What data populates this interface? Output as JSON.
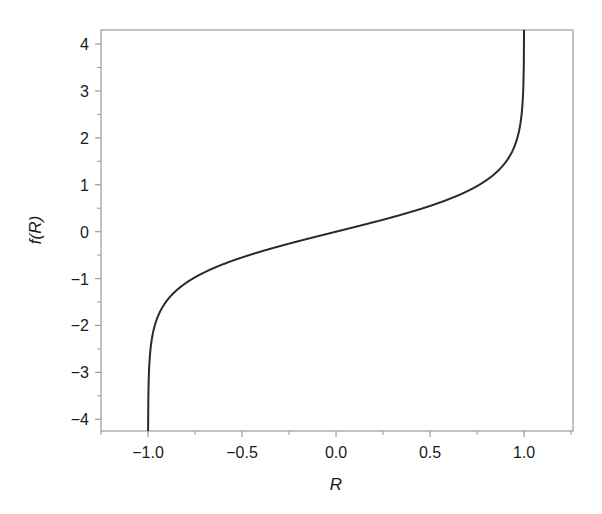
{
  "chart_data": {
    "type": "line",
    "title": "",
    "xlabel": "R",
    "ylabel": "f(R)",
    "function": "f(R) = atanh(R) = 0.5*ln((1+R)/(1-R))",
    "xlim": [
      -1.25,
      1.26
    ],
    "ylim": [
      -4.25,
      4.3
    ],
    "x_ticks": [
      -1.0,
      -0.5,
      0.0,
      0.5,
      1.0
    ],
    "x_tick_labels": [
      "−1.0",
      "−0.5",
      "0.0",
      "0.5",
      "1.0"
    ],
    "x_minor_ticks": [
      -1.25,
      -0.75,
      -0.25,
      0.25,
      0.75,
      1.25
    ],
    "y_ticks": [
      -4,
      -3,
      -2,
      -1,
      0,
      1,
      2,
      3,
      4
    ],
    "y_tick_labels": [
      "−4",
      "−3",
      "−2",
      "−1",
      "0",
      "1",
      "2",
      "3",
      "4"
    ],
    "y_minor_ticks": [
      -3.5,
      -2.5,
      -1.5,
      -0.5,
      0.5,
      1.5,
      2.5,
      3.5
    ],
    "grid": false,
    "legend": null,
    "series": [
      {
        "name": "f(R)",
        "x": [
          -0.9996,
          -0.999,
          -0.995,
          -0.99,
          -0.98,
          -0.95,
          -0.9,
          -0.8,
          -0.7,
          -0.6,
          -0.5,
          -0.4,
          -0.3,
          -0.2,
          -0.1,
          0.0,
          0.1,
          0.2,
          0.3,
          0.4,
          0.5,
          0.6,
          0.7,
          0.8,
          0.9,
          0.95,
          0.98,
          0.99,
          0.995,
          0.999,
          0.9996
        ],
        "values": [
          -4.26,
          -3.8,
          -2.99,
          -2.65,
          -2.3,
          -1.83,
          -1.47,
          -1.1,
          -0.87,
          -0.69,
          -0.55,
          -0.42,
          -0.31,
          -0.2,
          -0.1,
          0.0,
          0.1,
          0.2,
          0.31,
          0.42,
          0.55,
          0.69,
          0.87,
          1.1,
          1.47,
          1.83,
          2.3,
          2.65,
          2.99,
          3.8,
          4.26
        ],
        "color": "#2a2a2a"
      }
    ],
    "colors": {
      "frame": "#9a9a9a",
      "line": "#2a2a2a",
      "text": "#1a1a1a",
      "background": "#ffffff"
    }
  }
}
